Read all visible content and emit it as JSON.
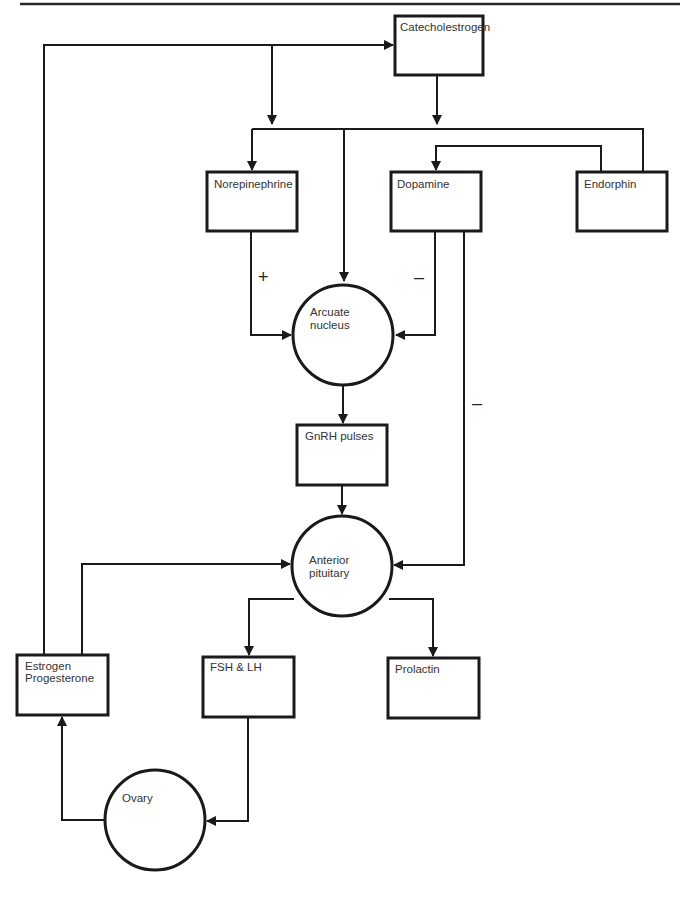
{
  "diagram": {
    "type": "flow",
    "nodes": {
      "catecholestrogen": {
        "label": "Catecholestrogen",
        "shape": "box"
      },
      "norepinephrine": {
        "label": "Norepinephrine",
        "shape": "box"
      },
      "dopamine": {
        "label": "Dopamine",
        "shape": "box"
      },
      "endorphin": {
        "label": "Endorphin",
        "shape": "box"
      },
      "arcuate": {
        "label_line1": "Arcuate",
        "label_line2": "nucleus",
        "shape": "circle"
      },
      "gnrh": {
        "label": "GnRH pulses",
        "shape": "box"
      },
      "pituitary": {
        "label_line1": "Anterior",
        "label_line2": "pituitary",
        "shape": "circle"
      },
      "estrogen": {
        "label_line1": "Estrogen",
        "label_line2": "Progesterone",
        "shape": "box"
      },
      "fshlh": {
        "label": "FSH & LH",
        "shape": "box"
      },
      "prolactin": {
        "label": "Prolactin",
        "shape": "box"
      },
      "ovary": {
        "label": "Ovary",
        "shape": "circle"
      }
    },
    "signs": {
      "norepinephrine_to_arcuate": "+",
      "dopamine_to_arcuate": "–",
      "dopamine_to_pituitary": "–"
    },
    "edges": [
      {
        "from": "estrogen",
        "to": "catecholestrogen"
      },
      {
        "from": "estrogen",
        "to": "norepinephrine"
      },
      {
        "from": "catecholestrogen",
        "to": "norepinephrine"
      },
      {
        "from": "catecholestrogen",
        "to": "arcuate"
      },
      {
        "from": "endorphin",
        "to": "dopamine"
      },
      {
        "from": "norepinephrine",
        "to": "arcuate",
        "sign": "+"
      },
      {
        "from": "dopamine",
        "to": "arcuate",
        "sign": "-"
      },
      {
        "from": "dopamine",
        "to": "pituitary",
        "sign": "-"
      },
      {
        "from": "arcuate",
        "to": "gnrh"
      },
      {
        "from": "gnrh",
        "to": "pituitary"
      },
      {
        "from": "estrogen",
        "to": "pituitary"
      },
      {
        "from": "pituitary",
        "to": "fshlh"
      },
      {
        "from": "pituitary",
        "to": "prolactin"
      },
      {
        "from": "fshlh",
        "to": "ovary"
      },
      {
        "from": "ovary",
        "to": "estrogen"
      }
    ]
  }
}
